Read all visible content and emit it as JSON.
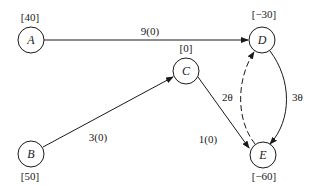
{
  "nodes": [
    {
      "id": "A",
      "label": "A",
      "supply": "[40]"
    },
    {
      "id": "B",
      "label": "B",
      "supply": "[50]"
    },
    {
      "id": "C",
      "label": "C",
      "supply": "[0]"
    },
    {
      "id": "D",
      "label": "D",
      "supply": "[−30]"
    },
    {
      "id": "E",
      "label": "E",
      "supply": "[−60]"
    }
  ],
  "edges": [
    {
      "from": "A",
      "to": "D",
      "label": "9(0)",
      "style": "solid"
    },
    {
      "from": "B",
      "to": "C",
      "label": "3(0)",
      "style": "solid"
    },
    {
      "from": "C",
      "to": "E",
      "label": "1(0)",
      "style": "solid"
    },
    {
      "from": "D",
      "to": "E",
      "label": "3θ",
      "style": "solid-curved"
    },
    {
      "from": "E",
      "to": "D",
      "label": "2θ",
      "style": "dashed-curved"
    }
  ]
}
